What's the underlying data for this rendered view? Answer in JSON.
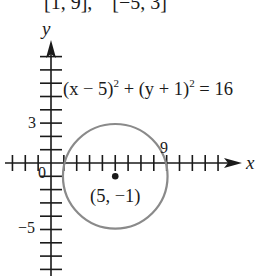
{
  "header_fragment": "[1, 9],    [−5, 3]",
  "axes": {
    "x_label": "x",
    "y_label": "y",
    "origin_label": "0",
    "y_tick_labels": [
      {
        "value": 3,
        "text": "3"
      },
      {
        "value": -5,
        "text": "−5"
      }
    ],
    "x_tick_labels": [
      {
        "value": 9,
        "text": "9"
      }
    ],
    "x_range": [
      -3,
      13
    ],
    "y_range": [
      -8,
      8
    ]
  },
  "equation": {
    "part1": "(x − 5)",
    "exp1": "2",
    "part2": " + (y + 1)",
    "exp2": "2",
    "part3": " = 16"
  },
  "circle": {
    "center": [
      5,
      -1
    ],
    "radius": 4,
    "center_label": "(5, −1)",
    "stroke_color": "#8a8a8a"
  },
  "chart_data": {
    "type": "scatter",
    "title": "",
    "xlabel": "x",
    "ylabel": "y",
    "xlim": [
      -3,
      13
    ],
    "ylim": [
      -8,
      8
    ],
    "grid": false,
    "series": [
      {
        "name": "circle (x − 5)^2 + (y + 1)^2 = 16",
        "shape": "circle",
        "center": [
          5,
          -1
        ],
        "radius": 4
      },
      {
        "name": "center point",
        "points": [
          [
            5,
            -1
          ]
        ],
        "label": "(5, −1)"
      }
    ],
    "annotations": [
      "(x − 5)^2 + (y + 1)^2 = 16",
      "(5, −1)",
      "9",
      "3",
      "−5",
      "0"
    ]
  }
}
